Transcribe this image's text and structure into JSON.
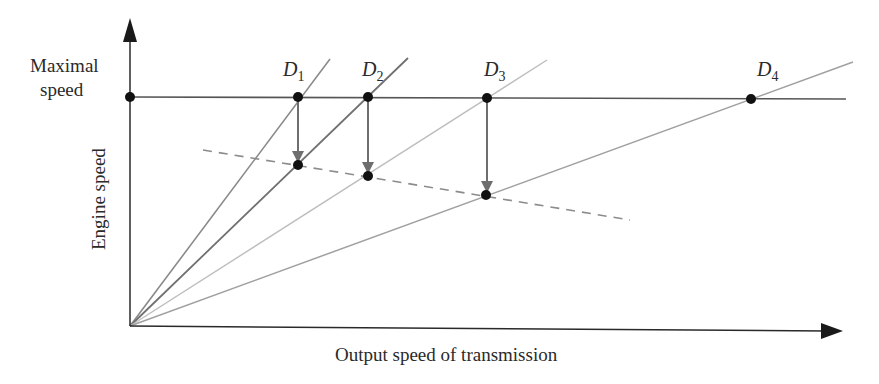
{
  "figure": {
    "y_axis_label": "Engine speed",
    "x_axis_label": "Output speed of transmission",
    "max_speed_label_line1": "Maximal",
    "max_speed_label_line2": "speed"
  },
  "gear_lines": [
    {
      "letter": "D",
      "subscript": "1",
      "slope_ratio": 1.35,
      "color": "#8a8a8a"
    },
    {
      "letter": "D",
      "subscript": "2",
      "slope_ratio": 1.0,
      "color": "#707070"
    },
    {
      "letter": "D",
      "subscript": "3",
      "slope_ratio": 0.64,
      "color": "#bdbdbd"
    },
    {
      "letter": "D",
      "subscript": "4",
      "slope_ratio": 0.365,
      "color": "#a0a0a0"
    }
  ],
  "colors": {
    "axis": "#2a2a2a",
    "max_line": "#555555",
    "arrow": "#6e6e6e",
    "dashed": "#8c8c8c",
    "point": "#111111"
  }
}
